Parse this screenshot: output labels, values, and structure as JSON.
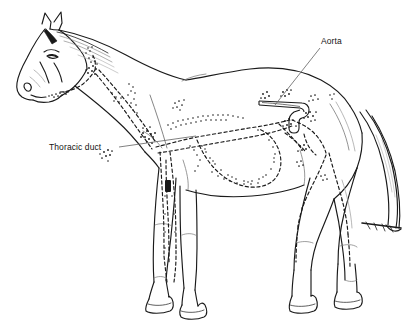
{
  "figure": {
    "name": "horse-lymphatic-system-diagram",
    "view": "left lateral whole-body outline",
    "background_color": "#ffffff",
    "line_color": "#1a1a1a",
    "width": 414,
    "height": 331
  },
  "labels": [
    {
      "id": "aorta",
      "text": "Aorta",
      "x": 321,
      "y": 36,
      "leader": {
        "from_x": 320,
        "from_y": 48,
        "to_x": 275,
        "to_y": 105
      }
    },
    {
      "id": "thoracic_duct",
      "text": "Thoracic duct",
      "x": 49,
      "y": 142,
      "leader": {
        "from_x": 119,
        "from_y": 147,
        "to_x": 196,
        "to_y": 136
      }
    }
  ],
  "structures": {
    "aorta_label": "Aorta",
    "thoracic_duct_label": "Thoracic duct"
  }
}
